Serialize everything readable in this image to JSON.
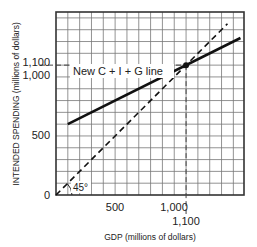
{
  "chart_data": {
    "type": "line",
    "title": "",
    "xlabel": "GDP (millions of dollars)",
    "ylabel": "INTENDED SPENDING (millions of dollars)",
    "xlim": [
      0,
      1590
    ],
    "ylim": [
      0,
      1550
    ],
    "grid": true,
    "grid_step": 100,
    "x_ticks": [
      {
        "value": 500,
        "label": "500"
      },
      {
        "value": 1000,
        "label": "1,000"
      },
      {
        "value": 1100,
        "label": "1,100"
      }
    ],
    "y_ticks": [
      {
        "value": 0,
        "label": "0"
      },
      {
        "value": 500,
        "label": "500"
      },
      {
        "value": 1000,
        "label": "1,000"
      },
      {
        "value": 1100,
        "label": "1,100"
      }
    ],
    "series": [
      {
        "name": "New C + I + G line",
        "style": "solid",
        "x": [
          100,
          1560
        ],
        "y": [
          600,
          1330
        ]
      },
      {
        "name": "45° line",
        "style": "dashed",
        "x": [
          0,
          1450
        ],
        "y": [
          0,
          1450
        ]
      }
    ],
    "annotations": [
      {
        "text": "New C + I + G line",
        "x": 150,
        "y": 990
      },
      {
        "text": "45°",
        "x": 120,
        "y": 40
      },
      {
        "text": "Equilibrium",
        "x": 1100,
        "y": 1100,
        "marker": "dot",
        "guides": "dashed"
      }
    ]
  },
  "labels": {
    "xlabel": "GDP (millions of dollars)",
    "ylabel": "INTENDED SPENDING (millions of dollars)",
    "line_label": "New C + I + G line",
    "angle_label": "45°",
    "x_tick_500": "500",
    "x_tick_1000": "1,000",
    "x_tick_1100": "1,100",
    "y_tick_0": "0",
    "y_tick_500": "500",
    "y_tick_1000": "1,000",
    "y_tick_1100": "1,100"
  },
  "colors": {
    "line": "#111111",
    "grid": "#555555",
    "axis": "#222222"
  }
}
